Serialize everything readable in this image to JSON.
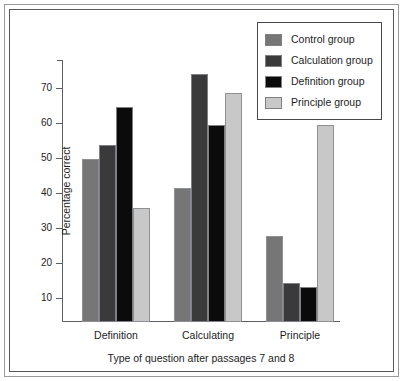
{
  "chart_data": {
    "type": "bar",
    "title": "",
    "xlabel": "Type of question after passages 7 and 8",
    "ylabel": "Percentage correct",
    "categories": [
      "Definition",
      "Calculating",
      "Principle"
    ],
    "series": [
      {
        "name": "Control group",
        "color": "#767676",
        "values": [
          49.8,
          41.5,
          27.5
        ]
      },
      {
        "name": "Calculation group",
        "color": "#3a3a3a",
        "values": [
          53.7,
          74.0,
          14.3
        ]
      },
      {
        "name": "Definition group",
        "color": "#0b0b0b",
        "values": [
          64.5,
          59.5,
          13.0
        ]
      },
      {
        "name": "Principle group",
        "color": "#c8c8c8",
        "values": [
          35.5,
          68.5,
          59.5
        ]
      }
    ],
    "ylim": [
      3,
      78
    ],
    "yticks": [
      10,
      20,
      30,
      40,
      50,
      60,
      70
    ],
    "ytick_labels": [
      "10",
      "20",
      "30",
      "40",
      "50",
      "60",
      "70"
    ],
    "grid": false,
    "legend_position": "top-right"
  },
  "legend": {
    "items": [
      {
        "label": "Control group",
        "swatch": "control-swatch"
      },
      {
        "label": "Calculation group",
        "swatch": "calculation-swatch"
      },
      {
        "label": "Definition group",
        "swatch": "definition-swatch"
      },
      {
        "label": "Principle group",
        "swatch": "principle-swatch"
      }
    ]
  },
  "colors": {
    "control": "#767676",
    "calculation": "#3a3a3a",
    "definition": "#0b0b0b",
    "principle": "#c8c8c8",
    "axis": "#5b5e62",
    "text": "#1d1d1d",
    "frame": "#55585c",
    "background": "#ffffff"
  }
}
